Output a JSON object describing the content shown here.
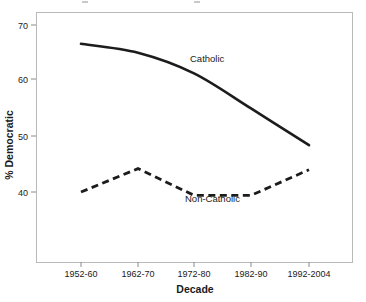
{
  "chart_data": {
    "type": "line",
    "title": "",
    "xlabel": "Decade",
    "ylabel": "% Democratic",
    "categories": [
      "1952-60",
      "1962-70",
      "1972-80",
      "1982-90",
      "1992-2004"
    ],
    "ylim": [
      34,
      72
    ],
    "yticks": [
      40,
      50,
      60,
      70
    ],
    "ytick_labels": [
      "40",
      "50",
      "60",
      "70"
    ],
    "grid": false,
    "legend_position": "inline-annotations",
    "series": [
      {
        "name": "Catholic",
        "style": "solid",
        "color": "#1c1c1c",
        "values": [
          66.6,
          65.0,
          61.3,
          55.0,
          48.4
        ],
        "annotation": "Catholic"
      },
      {
        "name": "Non-Catholic",
        "style": "dashed",
        "color": "#1c1c1c",
        "values": [
          40.0,
          44.2,
          39.4,
          39.4,
          44.0
        ],
        "annotation": "Non-Catholic"
      }
    ]
  },
  "axes": {
    "y_title": "% Democratic",
    "x_title": "Decade",
    "y_tick_0": "40",
    "y_tick_1": "50",
    "y_tick_2": "60",
    "y_tick_3": "70",
    "x_tick_0": "1952-60",
    "x_tick_1": "1962-70",
    "x_tick_2": "1972-80",
    "x_tick_3": "1982-90",
    "x_tick_4": "1992-2004"
  },
  "annotations": {
    "catholic": "Catholic",
    "non_catholic": "Non-Catholic"
  }
}
